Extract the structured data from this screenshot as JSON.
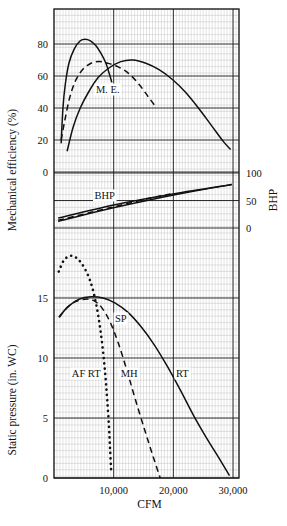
{
  "chart_data": {
    "type": "line",
    "title": "",
    "xlabel": "CFM",
    "ylabel_left_top": "Mechanical efficiency (%)",
    "ylabel_left_bottom": "Static pressure (in. WC)",
    "ylabel_right": "BHP",
    "grid": true,
    "legend_position": "inline-annotations",
    "xlim": [
      0,
      31000
    ],
    "xticks": [
      10000,
      20000,
      30000
    ],
    "xticklabels": [
      "10,000",
      "20,000",
      "30,000"
    ],
    "axes": [
      {
        "name": "mechanical-efficiency",
        "ylabel": "Mechanical efficiency (%)",
        "ylim": [
          0,
          100
        ],
        "yticks": [
          0,
          20,
          40,
          60,
          80
        ],
        "yticklabels": [
          "0",
          "20",
          "40",
          "60",
          "80"
        ]
      },
      {
        "name": "bhp",
        "ylabel": "BHP",
        "ylim": [
          -25,
          115
        ],
        "yticks": [
          0,
          50,
          100
        ],
        "yticklabels": [
          "0",
          "50",
          "100"
        ],
        "side": "right"
      },
      {
        "name": "static-pressure",
        "ylabel": "Static pressure (in. WC)",
        "ylim": [
          0,
          19
        ],
        "yticks": [
          0,
          5,
          10,
          15
        ],
        "yticklabels": [
          "0",
          "5",
          "10",
          "15"
        ]
      }
    ],
    "annotations": [
      {
        "text": "M. E.",
        "x": 9000,
        "panel": "mechanical-efficiency"
      },
      {
        "text": "BHP",
        "x": 8500,
        "panel": "bhp"
      },
      {
        "text": "SP",
        "x": 11200,
        "panel": "static-pressure"
      },
      {
        "text": "AF RT",
        "x": 5400,
        "panel": "static-pressure"
      },
      {
        "text": "MH",
        "x": 12600,
        "panel": "static-pressure"
      },
      {
        "text": "RT",
        "x": 21500,
        "panel": "static-pressure"
      }
    ],
    "series": [
      {
        "name": "Mechanical efficiency AF RT",
        "panel": "mechanical-efficiency",
        "style": "solid",
        "points": [
          [
            1200,
            18
          ],
          [
            1500,
            40
          ],
          [
            1900,
            55
          ],
          [
            2500,
            68
          ],
          [
            3400,
            77
          ],
          [
            4400,
            82
          ],
          [
            5200,
            83
          ],
          [
            6100,
            82
          ],
          [
            7000,
            79
          ],
          [
            7900,
            74
          ],
          [
            8700,
            68
          ],
          [
            9300,
            61
          ],
          [
            9700,
            56
          ]
        ]
      },
      {
        "name": "Mechanical efficiency MH",
        "panel": "mechanical-efficiency",
        "style": "dashed",
        "points": [
          [
            1200,
            20
          ],
          [
            1800,
            32
          ],
          [
            2600,
            46
          ],
          [
            3600,
            57
          ],
          [
            4800,
            64
          ],
          [
            6200,
            68
          ],
          [
            7600,
            69
          ],
          [
            9000,
            68
          ],
          [
            10600,
            66
          ],
          [
            12400,
            62
          ],
          [
            14200,
            55
          ],
          [
            15800,
            47
          ],
          [
            17200,
            40
          ]
        ]
      },
      {
        "name": "Mechanical efficiency RT",
        "panel": "mechanical-efficiency",
        "style": "solid",
        "points": [
          [
            2200,
            13
          ],
          [
            3200,
            28
          ],
          [
            4400,
            40
          ],
          [
            5800,
            50
          ],
          [
            7400,
            59
          ],
          [
            9200,
            65
          ],
          [
            11200,
            69
          ],
          [
            13200,
            70
          ],
          [
            15400,
            68
          ],
          [
            17600,
            64
          ],
          [
            19800,
            58
          ],
          [
            22000,
            50
          ],
          [
            24200,
            40
          ],
          [
            26400,
            29
          ],
          [
            28400,
            19
          ],
          [
            29600,
            14
          ]
        ]
      },
      {
        "name": "BHP AF RT",
        "panel": "bhp",
        "style": "solid",
        "points": [
          [
            700,
            18
          ],
          [
            10000,
            42
          ],
          [
            20000,
            62
          ],
          [
            29800,
            79
          ]
        ]
      },
      {
        "name": "BHP MH",
        "panel": "bhp",
        "style": "dashed",
        "points": [
          [
            700,
            14
          ],
          [
            6000,
            28
          ],
          [
            11000,
            41
          ],
          [
            16000,
            54
          ],
          [
            19500,
            62
          ]
        ]
      },
      {
        "name": "BHP RT",
        "panel": "bhp",
        "style": "solid",
        "points": [
          [
            700,
            12
          ],
          [
            8000,
            32
          ],
          [
            16000,
            51
          ],
          [
            24000,
            68
          ],
          [
            29800,
            79
          ]
        ]
      },
      {
        "name": "Static pressure AF RT",
        "panel": "static-pressure",
        "style": "dotted",
        "points": [
          [
            800,
            17.2
          ],
          [
            1600,
            18.1
          ],
          [
            2600,
            18.5
          ],
          [
            3600,
            18.4
          ],
          [
            4600,
            17.9
          ],
          [
            5600,
            17.0
          ],
          [
            6400,
            15.9
          ],
          [
            7100,
            14.4
          ],
          [
            7700,
            12.6
          ],
          [
            8200,
            10.6
          ],
          [
            8600,
            8.6
          ],
          [
            8900,
            6.6
          ],
          [
            9200,
            4.4
          ],
          [
            9400,
            2.4
          ],
          [
            9600,
            0.4
          ]
        ]
      },
      {
        "name": "Static pressure MH",
        "panel": "static-pressure",
        "style": "dashed",
        "points": [
          [
            900,
            13.4
          ],
          [
            2200,
            14.2
          ],
          [
            3600,
            14.7
          ],
          [
            5200,
            14.9
          ],
          [
            6600,
            14.8
          ],
          [
            8000,
            14.2
          ],
          [
            9400,
            13.0
          ],
          [
            10800,
            11.2
          ],
          [
            12200,
            9.0
          ],
          [
            13600,
            6.6
          ],
          [
            15200,
            4.0
          ],
          [
            16600,
            1.8
          ],
          [
            17800,
            0.0
          ]
        ]
      },
      {
        "name": "Static pressure RT",
        "panel": "static-pressure",
        "style": "solid",
        "points": [
          [
            800,
            13.4
          ],
          [
            2400,
            14.3
          ],
          [
            4200,
            14.9
          ],
          [
            6200,
            15.1
          ],
          [
            8200,
            15.0
          ],
          [
            10200,
            14.6
          ],
          [
            12400,
            13.8
          ],
          [
            14600,
            12.6
          ],
          [
            16800,
            11.1
          ],
          [
            19000,
            9.3
          ],
          [
            21200,
            7.3
          ],
          [
            23400,
            5.2
          ],
          [
            25600,
            3.3
          ],
          [
            27600,
            1.7
          ],
          [
            29400,
            0.2
          ]
        ]
      }
    ]
  }
}
